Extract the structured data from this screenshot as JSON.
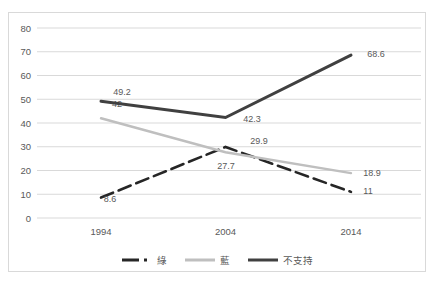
{
  "chart_data": {
    "type": "line",
    "title": "",
    "xlabel": "",
    "ylabel": "",
    "categories": [
      "1994",
      "2004",
      "2014"
    ],
    "series": [
      {
        "name": "綠",
        "color": "#262626",
        "style": "long-dash-dot",
        "width": 2.6,
        "values": [
          8.6,
          29.9,
          11
        ],
        "label_pos": [
          [
            110,
            199
          ],
          [
            259,
            141
          ],
          [
            368,
            191
          ]
        ]
      },
      {
        "name": "藍",
        "color": "#bfbfbf",
        "style": "solid",
        "width": 2.4,
        "values": [
          42,
          27.7,
          18.9
        ],
        "label_pos": [
          [
            117,
            104
          ],
          [
            226,
            166
          ],
          [
            372,
            173
          ]
        ]
      },
      {
        "name": "不支持",
        "color": "#404040",
        "style": "solid",
        "width": 3,
        "values": [
          49.2,
          42.3,
          68.6
        ],
        "label_pos": [
          [
            122,
            92
          ],
          [
            252,
            119
          ],
          [
            376,
            54
          ]
        ]
      }
    ],
    "ylim": [
      0,
      80
    ],
    "ytick_step": 10,
    "ytick_labels": [
      "0",
      "10",
      "20",
      "30",
      "40",
      "50",
      "60",
      "70",
      "80"
    ],
    "grid": true,
    "legend_position": "bottom",
    "colors": {
      "grid": "#d9d9d9",
      "axis_text": "#595959",
      "data_label_text": "#595959",
      "frame_border": "#d9d9d9",
      "background": "#ffffff"
    }
  }
}
